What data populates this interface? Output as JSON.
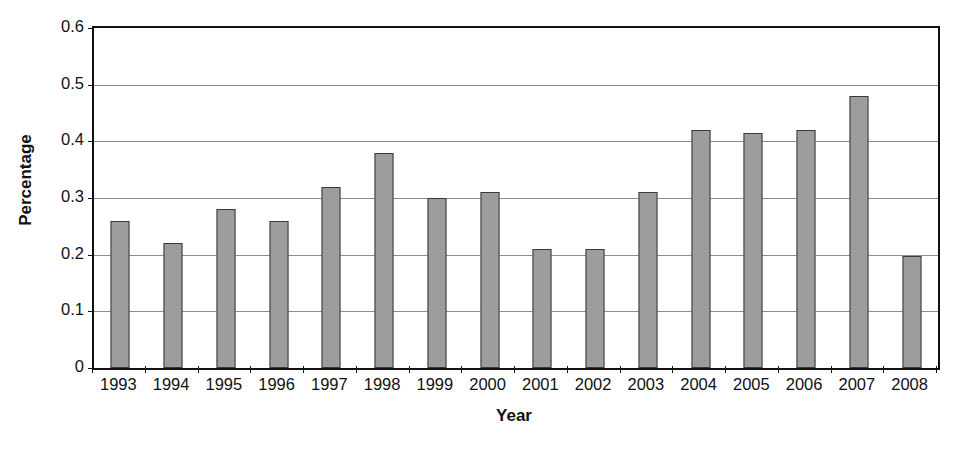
{
  "chart_data": {
    "type": "bar",
    "title": "",
    "xlabel": "Year",
    "ylabel": "Percentage",
    "categories": [
      "1993",
      "1994",
      "1995",
      "1996",
      "1997",
      "1998",
      "1999",
      "2000",
      "2001",
      "2002",
      "2003",
      "2004",
      "2005",
      "2006",
      "2007",
      "2008"
    ],
    "values": [
      0.26,
      0.22,
      0.28,
      0.26,
      0.32,
      0.38,
      0.3,
      0.31,
      0.21,
      0.21,
      0.31,
      0.42,
      0.415,
      0.42,
      0.48,
      0.198
    ],
    "ylim": [
      0,
      0.6
    ],
    "ytick_labels": [
      "0.6",
      "0.5",
      "0.4",
      "0.3",
      "0.2",
      "0.1",
      "0"
    ],
    "ytick_values": [
      0.6,
      0.5,
      0.4,
      0.3,
      0.2,
      0.1,
      0
    ],
    "gridlines": [
      0.5,
      0.4,
      0.3,
      0.2,
      0.1
    ],
    "grid": true,
    "legend": null,
    "bar_color": "#9d9d9d",
    "bar_border_color": "#3a3a3a",
    "axis_color": "#111111",
    "gridline_color": "#8c8c8c",
    "background": "#ffffff"
  }
}
